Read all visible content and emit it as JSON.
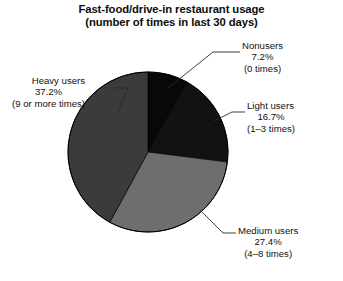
{
  "chart_data": {
    "type": "pie",
    "title": "Fast-food/drive-in restaurant usage",
    "subtitle": "(number of times in last 30 days)",
    "xlabel": "",
    "ylabel": "",
    "legend_position": "none",
    "grid": false,
    "total_percent": "88.5",
    "categories": [
      "Nonusers",
      "Light users",
      "Medium users",
      "Heavy users"
    ],
    "values": [
      7.2,
      16.7,
      27.4,
      37.2
    ],
    "slices": [
      {
        "name": "Nonusers",
        "percent": 7.2,
        "percent_label": "7.2%",
        "note": "(0 times)",
        "color": "#080808",
        "start_angle": 0,
        "end_angle": 29.3
      },
      {
        "name": "Light users",
        "percent": 16.7,
        "percent_label": "16.7%",
        "note": "(1–3 times)",
        "color": "#121212",
        "start_angle": 29.3,
        "end_angle": 97.2
      },
      {
        "name": "Medium users",
        "percent": 27.4,
        "percent_label": "27.4%",
        "note": "(4–8 times)",
        "color": "#6e6e6e",
        "start_angle": 97.2,
        "end_angle": 208.6
      },
      {
        "name": "Heavy users",
        "percent": 37.2,
        "percent_label": "37.2%",
        "note": "(9 or more times)",
        "color": "#3b3b3b",
        "start_angle": 208.6,
        "end_angle": 360
      }
    ]
  },
  "title": {
    "line1": "Fast-food/drive-in restaurant usage",
    "line2": "(number of times in last 30 days)"
  },
  "labels": {
    "nonusers": {
      "name": "Nonusers",
      "percent": "7.2%",
      "note": "(0 times)"
    },
    "light": {
      "name": "Light users",
      "percent": "16.7%",
      "note": "(1–3 times)"
    },
    "medium": {
      "name": "Medium users",
      "percent": "27.4%",
      "note": "(4–8 times)"
    },
    "heavy": {
      "name": "Heavy users",
      "percent": "37.2%",
      "note": "(9 or more times)"
    }
  },
  "colors": {
    "background": "#ffffff",
    "text": "#111111",
    "nonusers": "#080808",
    "light": "#121212",
    "medium": "#6e6e6e",
    "heavy": "#3b3b3b",
    "outline": "#000000",
    "leader_line": "#2a2a2a"
  }
}
